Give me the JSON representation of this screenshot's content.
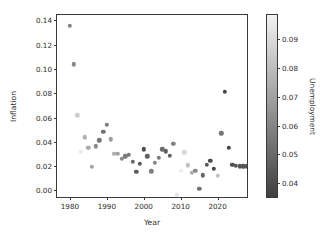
{
  "chart_data": {
    "type": "scatter",
    "title": "",
    "xlabel": "Year",
    "ylabel": "Inflation",
    "xlim": [
      1976.5,
      2028.5
    ],
    "ylim": [
      -0.007,
      0.1445
    ],
    "grid": false,
    "legend": null,
    "colormap": "greyscale (light = high unemployment, dark = low unemployment)",
    "colorbar": {
      "label": "Unemployment",
      "orientation": "vertical",
      "position": "right",
      "vmin": 0.0345,
      "vmax": 0.0985,
      "ticks": [
        0.04,
        0.05,
        0.06,
        0.07,
        0.08,
        0.09
      ],
      "tick_labels": [
        "0.04",
        "0.05",
        "0.06",
        "0.07",
        "0.08",
        "0.09"
      ],
      "top_color": "#f2f2f2",
      "bottom_color": "#3f3f3f"
    },
    "xticks": [
      1980,
      1990,
      2000,
      2010,
      2020
    ],
    "xtick_labels": [
      "1980",
      "1990",
      "2000",
      "2010",
      "2020"
    ],
    "yticks": [
      0.0,
      0.02,
      0.04,
      0.06,
      0.08,
      0.1,
      0.12,
      0.14
    ],
    "ytick_labels": [
      "0.00",
      "0.02",
      "0.04",
      "0.06",
      "0.08",
      "0.10",
      "0.12",
      "0.14"
    ],
    "xkey": "Year",
    "ykey": "Inflation",
    "ckey": "Unemployment",
    "points": [
      {
        "x": 1980,
        "y": 0.1355,
        "c": 0.0585
      },
      {
        "x": 1981,
        "y": 0.104,
        "c": 0.061
      },
      {
        "x": 1982,
        "y": 0.062,
        "c": 0.0858
      },
      {
        "x": 1983,
        "y": 0.032,
        "c": 0.096
      },
      {
        "x": 1984,
        "y": 0.0438,
        "c": 0.075
      },
      {
        "x": 1985,
        "y": 0.0352,
        "c": 0.072
      },
      {
        "x": 1986,
        "y": 0.0195,
        "c": 0.07
      },
      {
        "x": 1987,
        "y": 0.0365,
        "c": 0.062
      },
      {
        "x": 1988,
        "y": 0.0412,
        "c": 0.055
      },
      {
        "x": 1989,
        "y": 0.0482,
        "c": 0.053
      },
      {
        "x": 1990,
        "y": 0.054,
        "c": 0.056
      },
      {
        "x": 1991,
        "y": 0.042,
        "c": 0.0685
      },
      {
        "x": 1992,
        "y": 0.0303,
        "c": 0.075
      },
      {
        "x": 1993,
        "y": 0.03,
        "c": 0.069
      },
      {
        "x": 1994,
        "y": 0.0261,
        "c": 0.061
      },
      {
        "x": 1995,
        "y": 0.0281,
        "c": 0.056
      },
      {
        "x": 1996,
        "y": 0.0293,
        "c": 0.054
      },
      {
        "x": 1997,
        "y": 0.0234,
        "c": 0.0495
      },
      {
        "x": 1998,
        "y": 0.0155,
        "c": 0.045
      },
      {
        "x": 1999,
        "y": 0.0219,
        "c": 0.0422
      },
      {
        "x": 2000,
        "y": 0.0338,
        "c": 0.0399
      },
      {
        "x": 2001,
        "y": 0.0283,
        "c": 0.0473
      },
      {
        "x": 2002,
        "y": 0.0159,
        "c": 0.0578
      },
      {
        "x": 2003,
        "y": 0.0227,
        "c": 0.06
      },
      {
        "x": 2004,
        "y": 0.0268,
        "c": 0.0553
      },
      {
        "x": 2005,
        "y": 0.0339,
        "c": 0.0508
      },
      {
        "x": 2006,
        "y": 0.0323,
        "c": 0.0462
      },
      {
        "x": 2007,
        "y": 0.0285,
        "c": 0.0462
      },
      {
        "x": 2008,
        "y": 0.0384,
        "c": 0.0578
      },
      {
        "x": 2009,
        "y": -0.0036,
        "c": 0.093
      },
      {
        "x": 2010,
        "y": 0.0164,
        "c": 0.0962
      },
      {
        "x": 2011,
        "y": 0.0316,
        "c": 0.0893
      },
      {
        "x": 2012,
        "y": 0.0207,
        "c": 0.0812
      },
      {
        "x": 2013,
        "y": 0.0146,
        "c": 0.0737
      },
      {
        "x": 2014,
        "y": 0.0162,
        "c": 0.0617
      },
      {
        "x": 2015,
        "y": 0.0012,
        "c": 0.0528
      },
      {
        "x": 2016,
        "y": 0.0126,
        "c": 0.0487
      },
      {
        "x": 2017,
        "y": 0.0213,
        "c": 0.0435
      },
      {
        "x": 2018,
        "y": 0.0244,
        "c": 0.039
      },
      {
        "x": 2019,
        "y": 0.0181,
        "c": 0.0367
      },
      {
        "x": 2020,
        "y": 0.0123,
        "c": 0.0809
      },
      {
        "x": 2021,
        "y": 0.047,
        "c": 0.0537
      },
      {
        "x": 2022,
        "y": 0.0812,
        "c": 0.0365
      },
      {
        "x": 2023,
        "y": 0.035,
        "c": 0.0363
      },
      {
        "x": 2024,
        "y": 0.0212,
        "c": 0.04
      },
      {
        "x": 2025,
        "y": 0.0205,
        "c": 0.0421
      },
      {
        "x": 2026,
        "y": 0.02,
        "c": 0.0425
      },
      {
        "x": 2027,
        "y": 0.0199,
        "c": 0.0425
      },
      {
        "x": 2028,
        "y": 0.0198,
        "c": 0.0425
      }
    ]
  }
}
